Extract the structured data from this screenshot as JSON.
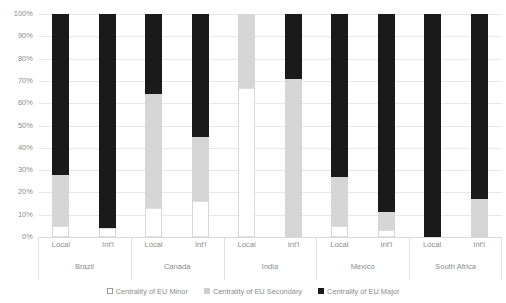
{
  "chart_data": {
    "type": "bar",
    "subtype": "100% stacked bar",
    "title": "",
    "xlabel": "",
    "ylabel": "",
    "ylim": [
      0,
      100
    ],
    "y_ticks": [
      "0%",
      "10%",
      "20%",
      "30%",
      "40%",
      "50%",
      "60%",
      "70%",
      "80%",
      "90%",
      "100%"
    ],
    "y_tick_values": [
      0,
      10,
      20,
      30,
      40,
      50,
      60,
      70,
      80,
      90,
      100
    ],
    "grid": true,
    "legend_position": "bottom",
    "groups": [
      "Brazil",
      "Canada",
      "India",
      "Mexico",
      "South Africa"
    ],
    "subcategories": [
      "Local",
      "Int'l"
    ],
    "categories": [
      "Brazil Local",
      "Brazil Int'l",
      "Canada Local",
      "Canada Int'l",
      "India Local",
      "India Int'l",
      "Mexico Local",
      "Mexico Int'l",
      "South Africa Local",
      "South Africa Int'l"
    ],
    "series": [
      {
        "name": "Centrality of EU Minor",
        "color": "#ffffff",
        "values": [
          5,
          4,
          13,
          16,
          67,
          0,
          5,
          3,
          0,
          0
        ]
      },
      {
        "name": "Centrality of EU Secondary",
        "color": "#d6d6d6",
        "values": [
          23,
          0,
          51,
          29,
          33,
          71,
          22,
          8,
          0,
          17
        ]
      },
      {
        "name": "Centrality of EU Major",
        "color": "#1a1a1a",
        "values": [
          72,
          96,
          36,
          55,
          0,
          29,
          73,
          89,
          100,
          83
        ]
      }
    ]
  },
  "axis": {
    "y_labels": [
      "100%",
      "90%",
      "80%",
      "70%",
      "60%",
      "50%",
      "40%",
      "30%",
      "20%",
      "10%",
      "0%"
    ]
  },
  "groups": [
    {
      "name": "Brazil",
      "bars": [
        {
          "label": "Local",
          "minor": 5,
          "secondary": 23,
          "major": 72
        },
        {
          "label": "Int'l",
          "minor": 4,
          "secondary": 0,
          "major": 96
        }
      ]
    },
    {
      "name": "Canada",
      "bars": [
        {
          "label": "Local",
          "minor": 13,
          "secondary": 51,
          "major": 36
        },
        {
          "label": "Int'l",
          "minor": 16,
          "secondary": 29,
          "major": 55
        }
      ]
    },
    {
      "name": "India",
      "bars": [
        {
          "label": "Local",
          "minor": 67,
          "secondary": 33,
          "major": 0
        },
        {
          "label": "Int'l",
          "minor": 0,
          "secondary": 71,
          "major": 29
        }
      ]
    },
    {
      "name": "Mexico",
      "bars": [
        {
          "label": "Local",
          "minor": 5,
          "secondary": 22,
          "major": 73
        },
        {
          "label": "Int'l",
          "minor": 3,
          "secondary": 8,
          "major": 89
        }
      ]
    },
    {
      "name": "South Africa",
      "bars": [
        {
          "label": "Local",
          "minor": 0,
          "secondary": 0,
          "major": 100
        },
        {
          "label": "Int'l",
          "minor": 0,
          "secondary": 17,
          "major": 83
        }
      ]
    }
  ],
  "legend": {
    "items": [
      {
        "label": "Centrality of EU Minor",
        "swatch": "minor"
      },
      {
        "label": "Centrality of EU Secondary",
        "swatch": "secondary"
      },
      {
        "label": "Centrality of EU Major",
        "swatch": "major"
      }
    ]
  },
  "colors": {
    "minor": "#ffffff",
    "minor_border": "#bfbfbf",
    "secondary": "#d6d6d6",
    "major": "#1a1a1a",
    "gridline": "#e8e8e8",
    "text": "#8c8c8c"
  }
}
